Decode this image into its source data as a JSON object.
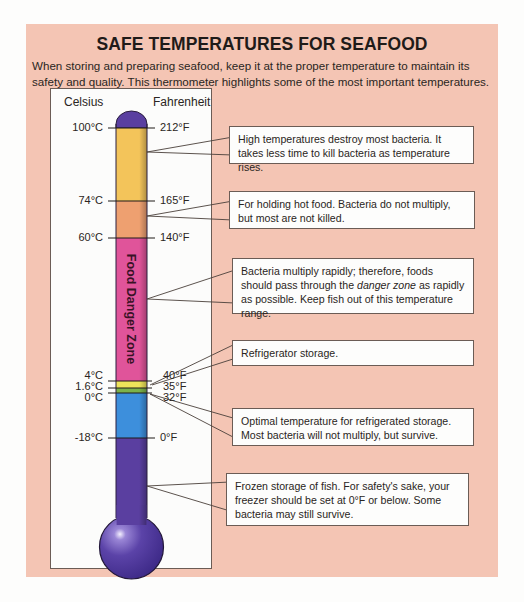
{
  "title": "SAFE TEMPERATURES FOR SEAFOOD",
  "intro": "When storing and preparing seafood, keep it at the proper temperature to maintain its safety and quality.  This thermometer highlights some of the most important temperatures.",
  "thermometer": {
    "celsius_header": "Celsius",
    "fahrenheit_header": "Fahrenheit",
    "danger_zone_label": "Food Danger Zone",
    "ticks": [
      {
        "celsius": "100°C",
        "fahrenheit": "212°F",
        "y": 128
      },
      {
        "celsius": "74°C",
        "fahrenheit": "165°F",
        "y": 201
      },
      {
        "celsius": "60°C",
        "fahrenheit": "140°F",
        "y": 238
      },
      {
        "celsius": "4°C",
        "fahrenheit": "40°F",
        "y": 381
      },
      {
        "celsius": "1.6°C",
        "fahrenheit": "35°F",
        "y": 388
      },
      {
        "celsius": "0°C",
        "fahrenheit": "32°F",
        "y": 393
      },
      {
        "celsius": "-18°C",
        "fahrenheit": "0°F",
        "y": 438
      }
    ],
    "bands": [
      {
        "name": "high-heat",
        "from": "100°C",
        "to": "74°C",
        "color": "#f3c45a"
      },
      {
        "name": "hot-holding",
        "from": "74°C",
        "to": "60°C",
        "color": "#eea070"
      },
      {
        "name": "danger-zone",
        "from": "60°C",
        "to": "4°C",
        "color": "#e0549a"
      },
      {
        "name": "refrigerator",
        "from": "4°C",
        "to": "1.6°C",
        "color": "#eee45a"
      },
      {
        "name": "optimal-refrigerated",
        "from": "1.6°C",
        "to": "0°C",
        "color": "#7cb24a"
      },
      {
        "name": "near-freezing",
        "from": "0°C",
        "to": "-18°C",
        "color": "#3d8fdc"
      },
      {
        "name": "frozen",
        "from": "-18°C",
        "to": "bulb",
        "color": "#5a3fa0"
      }
    ]
  },
  "callouts": [
    {
      "text": "High temperatures destroy most bacteria.  It takes less time to kill bacteria as temperature rises."
    },
    {
      "text": "For holding hot food.  Bacteria do not multiply, but most are not killed."
    },
    {
      "text_before": "Bacteria multiply rapidly;  therefore, foods should pass through the ",
      "text_em": "danger zone",
      "text_after": " as rapidly as possible. Keep fish out of this temperature range."
    },
    {
      "text": "Refrigerator storage."
    },
    {
      "text": "Optimal temperature for refrigerated storage.  Most bacteria will not multiply, but survive."
    },
    {
      "text": "Frozen storage of fish. For safety's sake, your freezer should be set at 0°F or below. Some bacteria may still survive."
    }
  ]
}
